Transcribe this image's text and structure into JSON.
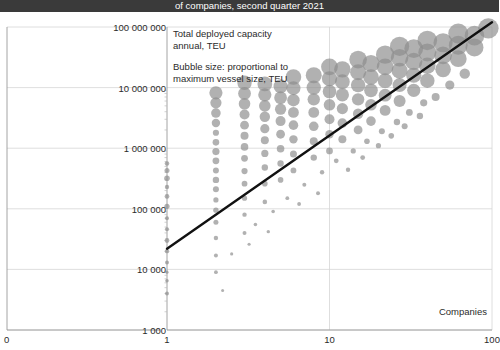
{
  "title": {
    "text": "of companies, second quarter 2021",
    "bar_color": "#3a3a3a",
    "text_color": "#ffffff"
  },
  "annotations": [
    {
      "name": "capacity-note",
      "text": "Total deployed capacity\nannual, TEU"
    },
    {
      "name": "bubble-size-note",
      "text": "Bubble size: proportional to\nmaximum vessel size, TEU"
    }
  ],
  "chart_data": {
    "type": "scatter",
    "title": "of companies, second quarter 2021",
    "xlabel": "Companies",
    "ylabel": "Total deployed capacity annual, TEU",
    "xscale": "log",
    "yscale": "log",
    "xlim": [
      1,
      100
    ],
    "ylim": [
      1000,
      100000000
    ],
    "grid": true,
    "legend": "none",
    "bubble_size_meaning": "proportional to maximum vessel size, TEU",
    "marker_color": "#8c8c8c",
    "marker_opacity": 0.68,
    "trendline": {
      "color": "#111111",
      "width": 2.4,
      "x": [
        1,
        100
      ],
      "y": [
        22000,
        120000000
      ]
    },
    "x_ticks": [
      {
        "value": 0,
        "label": "0",
        "broken_axis_origin": true
      },
      {
        "value": 1,
        "label": "1"
      },
      {
        "value": 10,
        "label": "10"
      },
      {
        "value": 100,
        "label": "100"
      }
    ],
    "y_ticks": [
      {
        "value": 1000,
        "label": "1 000"
      },
      {
        "value": 10000,
        "label": "10 000"
      },
      {
        "value": 100000,
        "label": "100 000"
      },
      {
        "value": 1000000,
        "label": "1 000 000"
      },
      {
        "value": 10000000,
        "label": "10 000 000"
      },
      {
        "value": 100000000,
        "label": "100 000 000"
      }
    ],
    "points": [
      {
        "x": 1,
        "y": 4000,
        "s": 2.0
      },
      {
        "x": 1,
        "y": 6500,
        "s": 1.8
      },
      {
        "x": 1,
        "y": 9000,
        "s": 1.6
      },
      {
        "x": 1,
        "y": 13000,
        "s": 2.0
      },
      {
        "x": 1,
        "y": 20000,
        "s": 2.2
      },
      {
        "x": 1,
        "y": 30000,
        "s": 2.4
      },
      {
        "x": 1,
        "y": 46000,
        "s": 2.1
      },
      {
        "x": 1,
        "y": 70000,
        "s": 2.0
      },
      {
        "x": 1,
        "y": 110000,
        "s": 2.6
      },
      {
        "x": 1,
        "y": 160000,
        "s": 2.4
      },
      {
        "x": 1,
        "y": 230000,
        "s": 2.2
      },
      {
        "x": 1,
        "y": 320000,
        "s": 2.8
      },
      {
        "x": 1,
        "y": 430000,
        "s": 2.5
      },
      {
        "x": 1,
        "y": 560000,
        "s": 2.3
      },
      {
        "x": 2,
        "y": 9000,
        "s": 1.9
      },
      {
        "x": 2,
        "y": 17000,
        "s": 2.0
      },
      {
        "x": 2,
        "y": 33000,
        "s": 2.2
      },
      {
        "x": 2,
        "y": 60000,
        "s": 2.5
      },
      {
        "x": 2,
        "y": 95000,
        "s": 2.7
      },
      {
        "x": 2,
        "y": 140000,
        "s": 2.6
      },
      {
        "x": 2,
        "y": 210000,
        "s": 3.0
      },
      {
        "x": 2,
        "y": 300000,
        "s": 3.2
      },
      {
        "x": 2,
        "y": 430000,
        "s": 3.0
      },
      {
        "x": 2,
        "y": 620000,
        "s": 3.4
      },
      {
        "x": 2,
        "y": 880000,
        "s": 3.6
      },
      {
        "x": 2,
        "y": 1250000,
        "s": 3.3
      },
      {
        "x": 2,
        "y": 1800000,
        "s": 3.1
      },
      {
        "x": 2,
        "y": 2600000,
        "s": 4.2
      },
      {
        "x": 2,
        "y": 3800000,
        "s": 4.8
      },
      {
        "x": 2,
        "y": 5600000,
        "s": 5.6
      },
      {
        "x": 2,
        "y": 8200000,
        "s": 6.6
      },
      {
        "x": 3,
        "y": 40000,
        "s": 2.0
      },
      {
        "x": 3,
        "y": 80000,
        "s": 2.2
      },
      {
        "x": 3,
        "y": 150000,
        "s": 2.6
      },
      {
        "x": 3,
        "y": 260000,
        "s": 2.9
      },
      {
        "x": 3,
        "y": 420000,
        "s": 3.1
      },
      {
        "x": 3,
        "y": 680000,
        "s": 3.4
      },
      {
        "x": 3,
        "y": 1050000,
        "s": 3.8
      },
      {
        "x": 3,
        "y": 1600000,
        "s": 4.0
      },
      {
        "x": 3,
        "y": 2400000,
        "s": 4.4
      },
      {
        "x": 3,
        "y": 3600000,
        "s": 5.0
      },
      {
        "x": 3,
        "y": 5400000,
        "s": 5.8
      },
      {
        "x": 3,
        "y": 8000000,
        "s": 6.4
      },
      {
        "x": 3,
        "y": 12000000,
        "s": 7.2
      },
      {
        "x": 4,
        "y": 130000,
        "s": 2.3
      },
      {
        "x": 4,
        "y": 260000,
        "s": 2.8
      },
      {
        "x": 4,
        "y": 480000,
        "s": 3.2
      },
      {
        "x": 4,
        "y": 820000,
        "s": 3.6
      },
      {
        "x": 4,
        "y": 1350000,
        "s": 4.0
      },
      {
        "x": 4,
        "y": 2100000,
        "s": 4.6
      },
      {
        "x": 4,
        "y": 3300000,
        "s": 5.2
      },
      {
        "x": 4,
        "y": 5000000,
        "s": 5.8
      },
      {
        "x": 4,
        "y": 7600000,
        "s": 6.6
      },
      {
        "x": 4,
        "y": 11500000,
        "s": 7.4
      },
      {
        "x": 5,
        "y": 300000,
        "s": 2.8
      },
      {
        "x": 5,
        "y": 560000,
        "s": 3.2
      },
      {
        "x": 5,
        "y": 980000,
        "s": 3.8
      },
      {
        "x": 5,
        "y": 1700000,
        "s": 4.4
      },
      {
        "x": 5,
        "y": 2800000,
        "s": 5.0
      },
      {
        "x": 5,
        "y": 4400000,
        "s": 5.6
      },
      {
        "x": 5,
        "y": 6800000,
        "s": 6.4
      },
      {
        "x": 5,
        "y": 10500000,
        "s": 7.0
      },
      {
        "x": 6,
        "y": 430000,
        "s": 2.9
      },
      {
        "x": 6,
        "y": 800000,
        "s": 3.5
      },
      {
        "x": 6,
        "y": 1400000,
        "s": 4.2
      },
      {
        "x": 6,
        "y": 2400000,
        "s": 4.8
      },
      {
        "x": 6,
        "y": 3900000,
        "s": 5.4
      },
      {
        "x": 6,
        "y": 6200000,
        "s": 6.2
      },
      {
        "x": 6,
        "y": 9800000,
        "s": 7.0
      },
      {
        "x": 6,
        "y": 15000000,
        "s": 7.8
      },
      {
        "x": 8,
        "y": 700000,
        "s": 3.2
      },
      {
        "x": 8,
        "y": 1300000,
        "s": 4.0
      },
      {
        "x": 8,
        "y": 2300000,
        "s": 4.8
      },
      {
        "x": 8,
        "y": 3900000,
        "s": 5.4
      },
      {
        "x": 8,
        "y": 6400000,
        "s": 6.2
      },
      {
        "x": 8,
        "y": 10000000,
        "s": 7.2
      },
      {
        "x": 8,
        "y": 16000000,
        "s": 8.0
      },
      {
        "x": 10,
        "y": 900000,
        "s": 3.4
      },
      {
        "x": 10,
        "y": 1700000,
        "s": 4.2
      },
      {
        "x": 10,
        "y": 3000000,
        "s": 5.0
      },
      {
        "x": 10,
        "y": 5200000,
        "s": 5.8
      },
      {
        "x": 10,
        "y": 8600000,
        "s": 6.8
      },
      {
        "x": 10,
        "y": 14000000,
        "s": 7.6
      },
      {
        "x": 10,
        "y": 22000000,
        "s": 8.4
      },
      {
        "x": 12,
        "y": 1400000,
        "s": 4.0
      },
      {
        "x": 12,
        "y": 2600000,
        "s": 4.8
      },
      {
        "x": 12,
        "y": 4500000,
        "s": 5.6
      },
      {
        "x": 12,
        "y": 7600000,
        "s": 6.6
      },
      {
        "x": 12,
        "y": 12500000,
        "s": 7.4
      },
      {
        "x": 12,
        "y": 20000000,
        "s": 8.2
      },
      {
        "x": 15,
        "y": 2000000,
        "s": 4.4
      },
      {
        "x": 15,
        "y": 3700000,
        "s": 5.2
      },
      {
        "x": 15,
        "y": 6400000,
        "s": 6.2
      },
      {
        "x": 15,
        "y": 11000000,
        "s": 7.2
      },
      {
        "x": 15,
        "y": 18000000,
        "s": 8.0
      },
      {
        "x": 15,
        "y": 29000000,
        "s": 8.8
      },
      {
        "x": 18,
        "y": 2800000,
        "s": 4.8
      },
      {
        "x": 18,
        "y": 5200000,
        "s": 5.8
      },
      {
        "x": 18,
        "y": 9000000,
        "s": 6.8
      },
      {
        "x": 18,
        "y": 15000000,
        "s": 7.8
      },
      {
        "x": 18,
        "y": 25000000,
        "s": 8.6
      },
      {
        "x": 22,
        "y": 4200000,
        "s": 5.4
      },
      {
        "x": 22,
        "y": 7500000,
        "s": 6.4
      },
      {
        "x": 22,
        "y": 13000000,
        "s": 7.4
      },
      {
        "x": 22,
        "y": 22000000,
        "s": 8.4
      },
      {
        "x": 22,
        "y": 35000000,
        "s": 9.2
      },
      {
        "x": 27,
        "y": 6000000,
        "s": 6.0
      },
      {
        "x": 27,
        "y": 11000000,
        "s": 7.0
      },
      {
        "x": 27,
        "y": 19000000,
        "s": 8.0
      },
      {
        "x": 27,
        "y": 31000000,
        "s": 8.8
      },
      {
        "x": 27,
        "y": 48000000,
        "s": 9.6
      },
      {
        "x": 33,
        "y": 9000000,
        "s": 6.6
      },
      {
        "x": 33,
        "y": 16000000,
        "s": 7.6
      },
      {
        "x": 33,
        "y": 27000000,
        "s": 8.6
      },
      {
        "x": 33,
        "y": 44000000,
        "s": 9.4
      },
      {
        "x": 40,
        "y": 13000000,
        "s": 7.2
      },
      {
        "x": 40,
        "y": 23000000,
        "s": 8.2
      },
      {
        "x": 40,
        "y": 38000000,
        "s": 9.0
      },
      {
        "x": 40,
        "y": 60000000,
        "s": 9.8
      },
      {
        "x": 50,
        "y": 20000000,
        "s": 7.8
      },
      {
        "x": 50,
        "y": 34000000,
        "s": 8.8
      },
      {
        "x": 50,
        "y": 55000000,
        "s": 9.6
      },
      {
        "x": 62,
        "y": 30000000,
        "s": 8.4
      },
      {
        "x": 62,
        "y": 50000000,
        "s": 9.4
      },
      {
        "x": 62,
        "y": 78000000,
        "s": 10.0
      },
      {
        "x": 78,
        "y": 46000000,
        "s": 9.0
      },
      {
        "x": 78,
        "y": 72000000,
        "s": 9.8
      },
      {
        "x": 95,
        "y": 95000000,
        "s": 10.2
      },
      {
        "x": 3.5,
        "y": 55000,
        "s": 1.8
      },
      {
        "x": 4.5,
        "y": 90000,
        "s": 1.8
      },
      {
        "x": 5.5,
        "y": 150000,
        "s": 1.9
      },
      {
        "x": 7,
        "y": 250000,
        "s": 2.0
      },
      {
        "x": 9,
        "y": 400000,
        "s": 2.2
      },
      {
        "x": 11,
        "y": 620000,
        "s": 2.4
      },
      {
        "x": 14,
        "y": 900000,
        "s": 2.6
      },
      {
        "x": 17,
        "y": 1300000,
        "s": 2.8
      },
      {
        "x": 21,
        "y": 1900000,
        "s": 3.0
      },
      {
        "x": 26,
        "y": 2700000,
        "s": 3.2
      },
      {
        "x": 31,
        "y": 3900000,
        "s": 3.4
      },
      {
        "x": 38,
        "y": 5600000,
        "s": 3.6
      },
      {
        "x": 2.5,
        "y": 18000,
        "s": 1.6
      },
      {
        "x": 3.2,
        "y": 26000,
        "s": 1.6
      },
      {
        "x": 2.2,
        "y": 4500,
        "s": 1.5
      },
      {
        "x": 4.2,
        "y": 42000,
        "s": 1.7
      },
      {
        "x": 6.5,
        "y": 120000,
        "s": 1.9
      },
      {
        "x": 8.5,
        "y": 180000,
        "s": 2.0
      },
      {
        "x": 13,
        "y": 440000,
        "s": 2.2
      },
      {
        "x": 16,
        "y": 700000,
        "s": 2.4
      },
      {
        "x": 20,
        "y": 1100000,
        "s": 2.6
      },
      {
        "x": 24,
        "y": 1600000,
        "s": 2.8
      },
      {
        "x": 29,
        "y": 2300000,
        "s": 3.0
      },
      {
        "x": 36,
        "y": 3400000,
        "s": 3.2
      },
      {
        "x": 45,
        "y": 7000000,
        "s": 4.0
      },
      {
        "x": 55,
        "y": 11000000,
        "s": 4.6
      },
      {
        "x": 68,
        "y": 17000000,
        "s": 5.2
      }
    ]
  },
  "axis_title": {
    "x": "Companies"
  }
}
